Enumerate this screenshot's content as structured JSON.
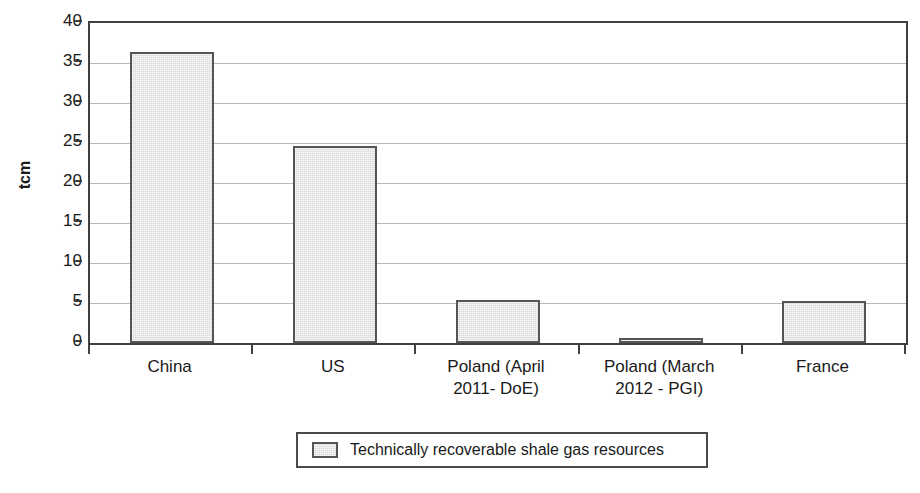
{
  "chart_data": {
    "type": "bar",
    "title": "",
    "xlabel": "",
    "ylabel": "tcm",
    "ylim": [
      0,
      40
    ],
    "yticks": [
      0,
      5,
      10,
      15,
      20,
      25,
      30,
      35,
      40
    ],
    "grid": true,
    "legend_position": "bottom",
    "categories": [
      "China",
      "Poland (April 2011- DoE)",
      "US",
      "Poland (March 2012 - PGI)",
      "France"
    ],
    "category_labels": [
      {
        "line1": "China",
        "line2": ""
      },
      {
        "line1": "US",
        "line2": ""
      },
      {
        "line1": "Poland (April",
        "line2": "2011- DoE)"
      },
      {
        "line1": "Poland (March",
        "line2": "2012 - PGI)"
      },
      {
        "line1": "France",
        "line2": ""
      }
    ],
    "series": [
      {
        "name": "Technically recoverable shale gas resources",
        "values": [
          36.4,
          24.6,
          5.4,
          0.6,
          5.3
        ],
        "color": "#d9d9d9",
        "border_color": "#555555"
      }
    ]
  },
  "legend": {
    "entries": [
      {
        "label": "Technically recoverable shale gas resources",
        "swatch_color": "#d9d9d9"
      }
    ]
  },
  "axis": {
    "y_title": "tcm",
    "tick_labels": [
      "40",
      "35",
      "30",
      "25",
      "20",
      "15",
      "10",
      "5",
      "0"
    ]
  }
}
